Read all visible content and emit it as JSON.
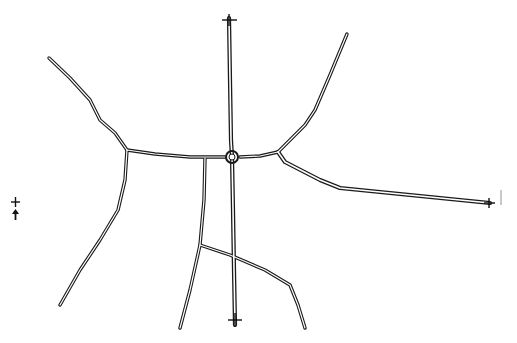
{
  "diagram": {
    "type": "road-network-sketch",
    "background": "#ffffff",
    "stroke_color": "#1a1a1a",
    "central_interchange": {
      "x": 232,
      "y": 157
    },
    "roads": [
      {
        "id": "north-highway",
        "points": "229,18 230,80 231,140 232,157"
      },
      {
        "id": "south-highway",
        "points": "232,157 233,210 234,270 235,325"
      },
      {
        "id": "west-road-to-junction",
        "points": "127,150 155,154 190,157 225,157"
      },
      {
        "id": "northwest-road",
        "points": "49,58 70,78 90,100 100,120 115,133 127,150"
      },
      {
        "id": "southwest-road",
        "points": "127,150 125,180 118,210 100,240 80,270 60,305"
      },
      {
        "id": "east-road-to-junction",
        "points": "240,157 260,156 278,152"
      },
      {
        "id": "northeast-road",
        "points": "278,152 295,135 305,125 315,110 330,75 347,34"
      },
      {
        "id": "east-highway",
        "points": "278,152 285,162 320,180 340,188 400,194 450,199 490,203"
      },
      {
        "id": "south-branch-left",
        "points": "205,158 204,200 200,245 190,290 180,328"
      },
      {
        "id": "south-branch-connector",
        "points": "200,245 230,255 265,270 290,285 298,305 305,328"
      }
    ],
    "endpoint_markers": [
      {
        "id": "north-end-marker",
        "x": 229,
        "y": 19
      },
      {
        "id": "east-end-marker",
        "x": 489,
        "y": 203
      },
      {
        "id": "south-end-marker",
        "x": 235,
        "y": 320
      }
    ],
    "legend_symbols": [
      {
        "id": "cross-symbol",
        "x": 15,
        "y": 202
      },
      {
        "id": "arrow-symbol",
        "x": 15,
        "y": 213
      }
    ]
  }
}
